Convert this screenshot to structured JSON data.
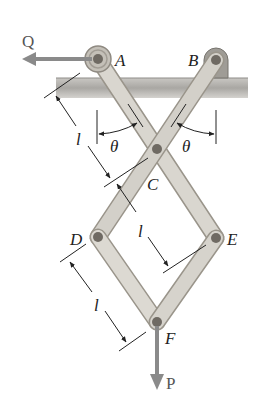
{
  "diagram": {
    "points": {
      "A": {
        "label": "A",
        "x": 98,
        "y": 59
      },
      "B": {
        "label": "B",
        "x": 216,
        "y": 60
      },
      "C": {
        "label": "C",
        "x": 157,
        "y": 149
      },
      "D": {
        "label": "D",
        "x": 98,
        "y": 237
      },
      "E": {
        "label": "E",
        "x": 216,
        "y": 238
      },
      "F": {
        "label": "F",
        "x": 157,
        "y": 322
      }
    },
    "forces": {
      "Q": {
        "label": "Q",
        "direction": "left"
      },
      "P": {
        "label": "P",
        "direction": "down"
      }
    },
    "angles": [
      {
        "label": "θ",
        "side": "left"
      },
      {
        "label": "θ",
        "side": "right"
      }
    ],
    "dimensions": [
      {
        "label": "l",
        "segment": "A-C"
      },
      {
        "label": "l",
        "segment": "C-E"
      },
      {
        "label": "l",
        "segment": "D-F"
      }
    ],
    "colors": {
      "link_fill": "#d9d6cf",
      "link_edge": "#9a958b",
      "pin": "#6f6a63",
      "ground": "#a8a6a2",
      "arrow": "#8a8a8a",
      "line": "#222222"
    }
  }
}
